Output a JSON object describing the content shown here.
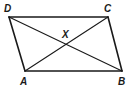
{
  "diagram": {
    "type": "parallelogram-with-diagonals",
    "colors": {
      "stroke": "#1a1a1a",
      "background": "#ffffff"
    },
    "vertices": [
      {
        "id": "D",
        "label": "D",
        "x": 9,
        "y": 17,
        "lx": 4,
        "ly": 12
      },
      {
        "id": "C",
        "label": "C",
        "x": 108,
        "y": 17,
        "lx": 104,
        "ly": 12
      },
      {
        "id": "B",
        "label": "B",
        "x": 122,
        "y": 71,
        "lx": 118,
        "ly": 85
      },
      {
        "id": "A",
        "label": "A",
        "x": 25,
        "y": 71,
        "lx": 20,
        "ly": 85
      }
    ],
    "intersection": {
      "id": "X",
      "label": "X",
      "x": 66,
      "y": 44,
      "lx": 62,
      "ly": 38
    },
    "sides": [
      [
        "D",
        "C"
      ],
      [
        "C",
        "B"
      ],
      [
        "B",
        "A"
      ],
      [
        "A",
        "D"
      ]
    ],
    "diagonals": [
      [
        "A",
        "C"
      ],
      [
        "D",
        "B"
      ]
    ]
  }
}
